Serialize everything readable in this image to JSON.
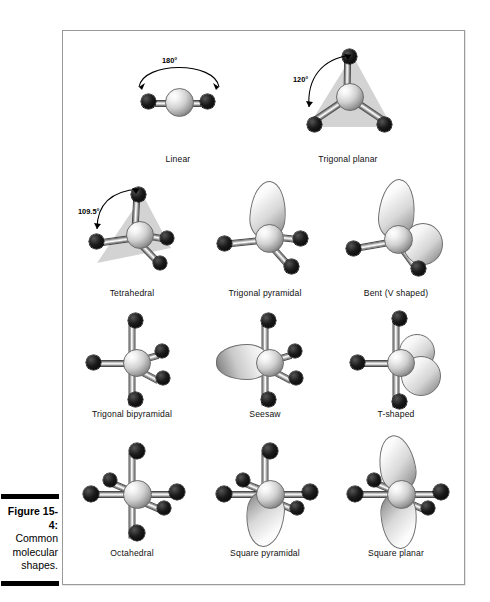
{
  "caption": {
    "figure_number": "Figure 15-4:",
    "line2": "Common",
    "line3": "molecular",
    "line4": "shapes."
  },
  "figure": {
    "shapes": [
      {
        "name": "Linear",
        "label": "Linear",
        "angle": "180°",
        "bonded_atoms": 2,
        "lone_pairs": 0,
        "plane": "none"
      },
      {
        "name": "Trigonal planar",
        "label": "Trigonal planar",
        "angle": "120°",
        "bonded_atoms": 3,
        "lone_pairs": 0,
        "plane": "triangle"
      },
      {
        "name": "Tetrahedral",
        "label": "Tetrahedral",
        "angle": "109.5°",
        "bonded_atoms": 4,
        "lone_pairs": 0,
        "plane": "triangle"
      },
      {
        "name": "Trigonal pyramidal",
        "label": "Trigonal pyramidal",
        "angle": "",
        "bonded_atoms": 3,
        "lone_pairs": 1,
        "plane": "none"
      },
      {
        "name": "Bent (V shaped)",
        "label": "Bent (V shaped)",
        "angle": "",
        "bonded_atoms": 2,
        "lone_pairs": 2,
        "plane": "none"
      },
      {
        "name": "Trigonal bipyramidal",
        "label": "Trigonal bipyramidal",
        "angle": "",
        "bonded_atoms": 5,
        "lone_pairs": 0,
        "plane": "none"
      },
      {
        "name": "Seesaw",
        "label": "Seesaw",
        "angle": "",
        "bonded_atoms": 4,
        "lone_pairs": 1,
        "plane": "none"
      },
      {
        "name": "T-shaped",
        "label": "T-shaped",
        "angle": "",
        "bonded_atoms": 3,
        "lone_pairs": 2,
        "plane": "none"
      },
      {
        "name": "Octahedral",
        "label": "Octahedral",
        "angle": "",
        "bonded_atoms": 6,
        "lone_pairs": 0,
        "plane": "none"
      },
      {
        "name": "Square pyramidal",
        "label": "Square pyramidal",
        "angle": "",
        "bonded_atoms": 5,
        "lone_pairs": 1,
        "plane": "none"
      },
      {
        "name": "Square planar",
        "label": "Square planar",
        "angle": "",
        "bonded_atoms": 4,
        "lone_pairs": 2,
        "plane": "none"
      }
    ]
  },
  "colors": {
    "atom": "#000000",
    "central_atom": "#c8c8c8",
    "lone_pair": "#dcdcdc",
    "plane": "#d3d3d3",
    "frame_border": "#9a9a9a",
    "background": "#ffffff",
    "text": "#000000"
  }
}
